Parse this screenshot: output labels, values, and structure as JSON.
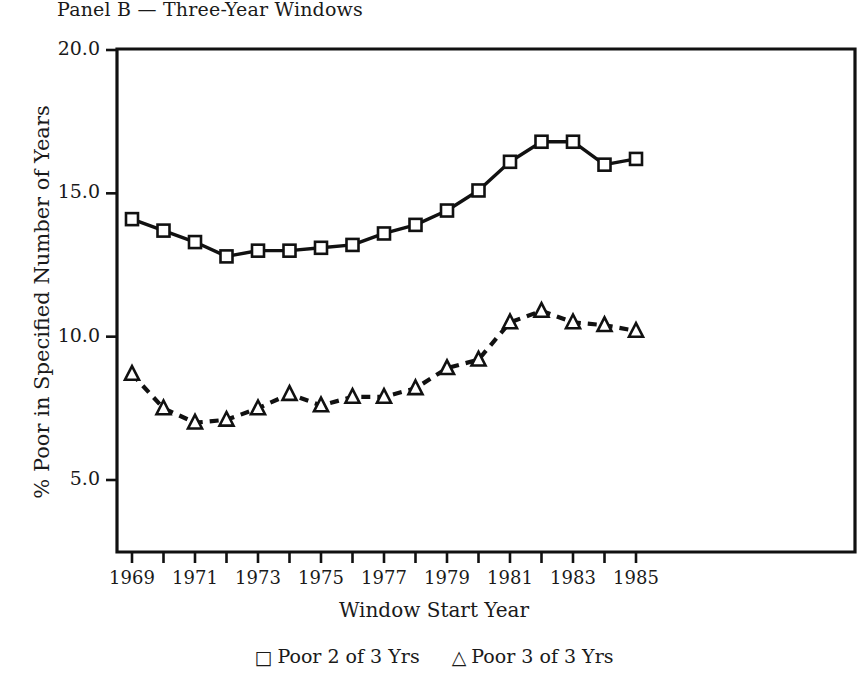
{
  "chart_data": {
    "type": "line",
    "title": "Panel B — Three-Year Windows",
    "xlabel": "Window Start Year",
    "ylabel": "% Poor in Specified Number of Years",
    "x": [
      1969,
      1970,
      1971,
      1972,
      1973,
      1974,
      1975,
      1976,
      1977,
      1978,
      1979,
      1980,
      1981,
      1982,
      1983,
      1984,
      1985
    ],
    "xlim": [
      1968.5,
      1986.5
    ],
    "ylim": [
      2.5,
      20.0
    ],
    "ytick_labels": [
      "20.0",
      "15.0",
      "10.0",
      "5.0"
    ],
    "ytick_values": [
      20.0,
      15.0,
      10.0,
      5.0
    ],
    "xtick_labels": [
      "1969",
      "1971",
      "1973",
      "1975",
      "1977",
      "1979",
      "1981",
      "1983",
      "1985"
    ],
    "xtick_values": [
      1969,
      1971,
      1973,
      1975,
      1977,
      1979,
      1981,
      1983,
      1985
    ],
    "grid": false,
    "legend_position": "below-bottom-center",
    "series": [
      {
        "name": "Poor 2 of 3 Yrs",
        "marker": "square",
        "linestyle": "solid",
        "color": "#111111",
        "values": [
          14.1,
          13.7,
          13.3,
          12.8,
          13.0,
          13.0,
          13.1,
          13.2,
          13.6,
          13.9,
          14.4,
          15.1,
          16.1,
          16.8,
          16.8,
          16.0,
          16.2
        ]
      },
      {
        "name": "Poor 3 of 3 Yrs",
        "marker": "triangle",
        "linestyle": "dashed",
        "color": "#111111",
        "values": [
          8.7,
          7.5,
          7.0,
          7.1,
          7.5,
          8.0,
          7.6,
          7.9,
          7.9,
          8.2,
          8.9,
          9.2,
          10.5,
          10.9,
          10.5,
          10.4,
          10.2
        ]
      }
    ]
  },
  "legend": {
    "items": [
      {
        "symbol": "□",
        "label": "Poor 2 of 3 Yrs"
      },
      {
        "symbol": "△",
        "label": "Poor 3 of 3 Yrs"
      }
    ]
  }
}
